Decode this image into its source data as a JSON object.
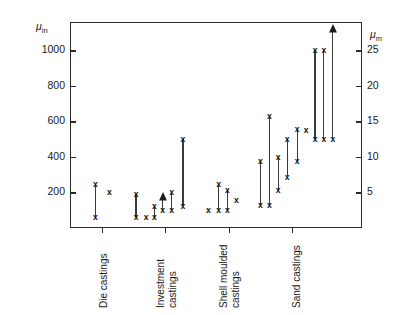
{
  "chart": {
    "ylabel": "Surface roughness",
    "unit_left": "μin",
    "unit_left_sub": "in",
    "unit_right": "μm",
    "unit_right_sub": "m"
  },
  "chart_data": {
    "type": "scatter",
    "title": "",
    "xlabel": "",
    "ylabel": "Surface roughness",
    "y_unit_primary": "μin",
    "y_unit_secondary": "μm",
    "ylim": [
      0,
      1160
    ],
    "ylim_secondary": [
      0,
      29
    ],
    "grid": false,
    "legend": "none",
    "yticks_left": [
      200,
      400,
      600,
      800,
      1000
    ],
    "yticklabels_left": [
      "200",
      "400",
      "600",
      "800",
      "1000"
    ],
    "yticks_right": [
      5,
      10,
      15,
      20,
      25
    ],
    "yticklabels_right": [
      "5",
      "10",
      "15",
      "20",
      "25"
    ],
    "categories": [
      "Die castings",
      "Investment castings",
      "Shell moulded castings",
      "Sand castings"
    ],
    "category_labels_wrapped": [
      [
        "Die castings"
      ],
      [
        "Investment",
        "castings"
      ],
      [
        "Shell moulded",
        "castings"
      ],
      [
        "Sand castings"
      ]
    ],
    "marker": "x",
    "series_note": "Vertical bars span the min-max surface roughness range for each process variant; isolated crosses are single values; upward arrows denote open-ended upper limits.",
    "ranges": [
      {
        "category": "Die castings",
        "x": 0.4,
        "low": 63,
        "high": 250,
        "arrow": false
      },
      {
        "category": "Die castings",
        "x": 0.62,
        "low": 200,
        "high": 200,
        "arrow": false
      },
      {
        "category": "Investment castings",
        "x": 1.04,
        "low": 63,
        "high": 190,
        "arrow": false
      },
      {
        "category": "Investment castings",
        "x": 1.2,
        "low": 63,
        "high": 63,
        "arrow": false
      },
      {
        "category": "Investment castings",
        "x": 1.33,
        "low": 63,
        "high": 125,
        "arrow": false
      },
      {
        "category": "Investment castings",
        "x": 1.46,
        "low": 100,
        "high": 190,
        "arrow": true
      },
      {
        "category": "Investment castings",
        "x": 1.6,
        "low": 100,
        "high": 200,
        "arrow": false
      },
      {
        "category": "Investment castings",
        "x": 1.78,
        "low": 125,
        "high": 500,
        "arrow": false
      },
      {
        "category": "Shell moulded castings",
        "x": 2.18,
        "low": 100,
        "high": 100,
        "arrow": false
      },
      {
        "category": "Shell moulded castings",
        "x": 2.34,
        "low": 100,
        "high": 250,
        "arrow": false
      },
      {
        "category": "Shell moulded castings",
        "x": 2.48,
        "low": 100,
        "high": 215,
        "arrow": false
      },
      {
        "category": "Shell moulded castings",
        "x": 2.62,
        "low": 160,
        "high": 160,
        "arrow": false
      },
      {
        "category": "Sand castings",
        "x": 3.0,
        "low": 130,
        "high": 380,
        "arrow": false
      },
      {
        "category": "Sand castings",
        "x": 3.14,
        "low": 130,
        "high": 630,
        "arrow": false
      },
      {
        "category": "Sand castings",
        "x": 3.28,
        "low": 215,
        "high": 400,
        "arrow": false
      },
      {
        "category": "Sand castings",
        "x": 3.42,
        "low": 290,
        "high": 500,
        "arrow": false
      },
      {
        "category": "Sand castings",
        "x": 3.58,
        "low": 380,
        "high": 560,
        "arrow": false
      },
      {
        "category": "Sand castings",
        "x": 3.72,
        "low": 550,
        "high": 550,
        "arrow": false
      },
      {
        "category": "Sand castings",
        "x": 3.86,
        "low": 500,
        "high": 1000,
        "arrow": false
      },
      {
        "category": "Sand castings",
        "x": 4.0,
        "low": 500,
        "high": 1000,
        "arrow": false
      },
      {
        "category": "Sand castings",
        "x": 4.14,
        "low": 500,
        "high": 1140,
        "arrow": true
      }
    ]
  }
}
